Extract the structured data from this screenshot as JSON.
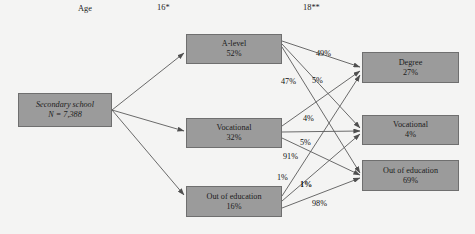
{
  "figure": {
    "background_color": "#f4f4f3",
    "node_fill": "#9b9b9b",
    "node_border": "#6f6f6f",
    "edge_color": "#5a5a5a"
  },
  "stage_labels": [
    {
      "name": "age",
      "text": "Age",
      "x": 78,
      "y": 4
    },
    {
      "name": "age-16",
      "text": "16*",
      "x": 157,
      "y": 3
    },
    {
      "name": "age-18",
      "text": "18**",
      "x": 303,
      "y": 3
    }
  ],
  "nodes": [
    {
      "id": "secondary-school",
      "line1": "Secondary school",
      "line2": "N = 7,388",
      "x": 18,
      "y": 93,
      "w": 94,
      "h": 34,
      "italic": true
    },
    {
      "id": "a-level-16",
      "line1": "A-level",
      "line2": "52%",
      "x": 186,
      "y": 34,
      "w": 96,
      "h": 30,
      "italic": false
    },
    {
      "id": "vocational-16",
      "line1": "Vocational",
      "line2": "32%",
      "x": 186,
      "y": 118,
      "w": 96,
      "h": 30,
      "italic": false
    },
    {
      "id": "out-of-education-16",
      "line1": "Out of education",
      "line2": "16%",
      "x": 186,
      "y": 186,
      "w": 96,
      "h": 31,
      "italic": false
    },
    {
      "id": "degree-18",
      "line1": "Degree",
      "line2": "27%",
      "x": 362,
      "y": 52,
      "w": 97,
      "h": 31,
      "italic": false
    },
    {
      "id": "vocational-18",
      "line1": "Vocational",
      "line2": "4%",
      "x": 362,
      "y": 115,
      "w": 97,
      "h": 30,
      "italic": false
    },
    {
      "id": "out-of-education-18",
      "line1": "Out of education",
      "line2": "69%",
      "x": 362,
      "y": 160,
      "w": 97,
      "h": 31,
      "italic": false
    }
  ],
  "edge_labels": [
    {
      "name": "edge-label-a-level-to-degree",
      "text": "49%",
      "x": 316,
      "y": 49,
      "bold": false
    },
    {
      "name": "edge-label-a-level-to-vocational",
      "text": "47%",
      "x": 281,
      "y": 77,
      "bold": false
    },
    {
      "name": "edge-label-a-level-to-out",
      "text": "5%",
      "x": 312,
      "y": 76,
      "bold": false
    },
    {
      "name": "edge-label-vocational-to-degree",
      "text": "4%",
      "x": 303,
      "y": 114,
      "bold": false
    },
    {
      "name": "edge-label-vocational-to-vocational",
      "text": "5%",
      "x": 300,
      "y": 138,
      "bold": false
    },
    {
      "name": "edge-label-vocational-to-out",
      "text": "91%",
      "x": 283,
      "y": 152,
      "bold": false
    },
    {
      "name": "edge-label-out-to-degree",
      "text": "1%",
      "x": 277,
      "y": 173,
      "bold": false
    },
    {
      "name": "edge-label-out-to-vocational",
      "text": "1%",
      "x": 300,
      "y": 180,
      "bold": true
    },
    {
      "name": "edge-label-out-to-out",
      "text": "98%",
      "x": 312,
      "y": 199,
      "bold": false
    }
  ],
  "edges": [
    {
      "name": "edge-secondary-to-a-level",
      "from": "secondary-school",
      "to": "a-level-16",
      "x1": 112,
      "y1": 110,
      "x2": 184,
      "y2": 53,
      "value": ""
    },
    {
      "name": "edge-secondary-to-vocational",
      "from": "secondary-school",
      "to": "vocational-16",
      "x1": 112,
      "y1": 110,
      "x2": 184,
      "y2": 131,
      "value": ""
    },
    {
      "name": "edge-secondary-to-out",
      "from": "secondary-school",
      "to": "out-of-education-16",
      "x1": 112,
      "y1": 110,
      "x2": 184,
      "y2": 195,
      "value": ""
    },
    {
      "name": "edge-a-level-to-degree",
      "from": "a-level-16",
      "to": "degree-18",
      "x1": 282,
      "y1": 41,
      "x2": 360,
      "y2": 67,
      "value": "49%"
    },
    {
      "name": "edge-a-level-to-vocational",
      "from": "a-level-16",
      "to": "vocational-18",
      "x1": 282,
      "y1": 44,
      "x2": 360,
      "y2": 128,
      "value": "47%"
    },
    {
      "name": "edge-a-level-to-out",
      "from": "a-level-16",
      "to": "out-of-education-18",
      "x1": 282,
      "y1": 47,
      "x2": 360,
      "y2": 173,
      "value": "5%"
    },
    {
      "name": "edge-vocational-to-degree",
      "from": "vocational-16",
      "to": "degree-18",
      "x1": 282,
      "y1": 126,
      "x2": 360,
      "y2": 71,
      "value": "4%"
    },
    {
      "name": "edge-vocational-to-vocational",
      "from": "vocational-16",
      "to": "vocational-18",
      "x1": 282,
      "y1": 132,
      "x2": 360,
      "y2": 131,
      "value": "5%"
    },
    {
      "name": "edge-vocational-to-out",
      "from": "vocational-16",
      "to": "out-of-education-18",
      "x1": 282,
      "y1": 138,
      "x2": 360,
      "y2": 175,
      "value": "91%"
    },
    {
      "name": "edge-out-to-degree",
      "from": "out-of-education-16",
      "to": "degree-18",
      "x1": 282,
      "y1": 196,
      "x2": 360,
      "y2": 75,
      "value": "1%"
    },
    {
      "name": "edge-out-to-vocational",
      "from": "out-of-education-16",
      "to": "vocational-18",
      "x1": 282,
      "y1": 201,
      "x2": 360,
      "y2": 134,
      "value": "1%"
    },
    {
      "name": "edge-out-to-out",
      "from": "out-of-education-16",
      "to": "out-of-education-18",
      "x1": 282,
      "y1": 208,
      "x2": 360,
      "y2": 178,
      "value": "98%"
    }
  ]
}
